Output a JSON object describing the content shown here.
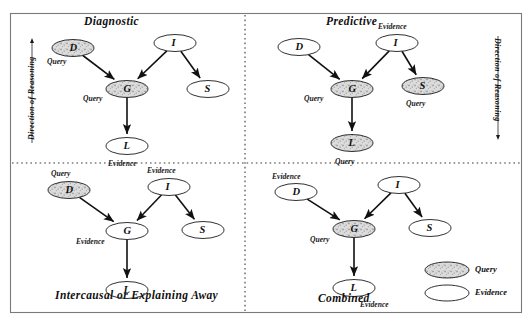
{
  "figure": {
    "background": "#ffffff",
    "border_color": "#7a7a7a",
    "divider_color": "#3a3a3a",
    "node_stroke": "#1a1a1a",
    "query_fill": "#d8d8d8",
    "evidence_fill": "#ffffff",
    "arrow_color": "#111111"
  },
  "panels": {
    "diagnostic": {
      "title": "Diagnostic",
      "direction_label": "Direction of Reasoning",
      "direction_arrow": "up",
      "nodes": [
        {
          "id": "D",
          "label": "D",
          "type": "query",
          "tag": "Query",
          "cx": 73,
          "cy": 48
        },
        {
          "id": "I",
          "label": "I",
          "type": "evidence",
          "tag": "",
          "cx": 175,
          "cy": 43
        },
        {
          "id": "G",
          "label": "G",
          "type": "query",
          "tag": "Query",
          "cx": 127,
          "cy": 89
        },
        {
          "id": "S",
          "label": "S",
          "type": "evidence",
          "tag": "",
          "cx": 208,
          "cy": 89
        },
        {
          "id": "L",
          "label": "L",
          "type": "evidence",
          "tag": "Evidence",
          "cx": 127,
          "cy": 146
        }
      ],
      "edges": [
        {
          "from": "D",
          "to": "G"
        },
        {
          "from": "I",
          "to": "G"
        },
        {
          "from": "I",
          "to": "S"
        },
        {
          "from": "G",
          "to": "L"
        }
      ]
    },
    "predictive": {
      "title": "Predictive",
      "direction_label": "Direction of Reasoning",
      "direction_arrow": "down",
      "nodes": [
        {
          "id": "D",
          "label": "D",
          "type": "evidence",
          "tag": "",
          "cx": 299,
          "cy": 47
        },
        {
          "id": "I",
          "label": "I",
          "type": "evidence",
          "tag": "Evidence",
          "cx": 397,
          "cy": 43
        },
        {
          "id": "G",
          "label": "G",
          "type": "query",
          "tag": "Query",
          "cx": 352,
          "cy": 89
        },
        {
          "id": "S",
          "label": "S",
          "type": "query",
          "tag": "Query",
          "cx": 423,
          "cy": 86
        },
        {
          "id": "L",
          "label": "L",
          "type": "query",
          "tag": "Query",
          "cx": 352,
          "cy": 143
        }
      ],
      "edges": [
        {
          "from": "D",
          "to": "G"
        },
        {
          "from": "I",
          "to": "G"
        },
        {
          "from": "I",
          "to": "S"
        },
        {
          "from": "G",
          "to": "L"
        }
      ]
    },
    "intercausal": {
      "title": "Intercausal or Explaining Away",
      "nodes": [
        {
          "id": "D",
          "label": "D",
          "type": "query",
          "tag": "Query",
          "cx": 69,
          "cy": 190
        },
        {
          "id": "I",
          "label": "I",
          "type": "evidence",
          "tag": "Evidence",
          "cx": 169,
          "cy": 187
        },
        {
          "id": "G",
          "label": "G",
          "type": "evidence",
          "tag": "Evidence",
          "cx": 127,
          "cy": 231
        },
        {
          "id": "S",
          "label": "S",
          "type": "evidence",
          "tag": "",
          "cx": 203,
          "cy": 230
        },
        {
          "id": "L",
          "label": "L",
          "type": "evidence",
          "tag": "",
          "cx": 127,
          "cy": 290
        }
      ],
      "edges": [
        {
          "from": "D",
          "to": "G"
        },
        {
          "from": "I",
          "to": "G"
        },
        {
          "from": "I",
          "to": "S"
        },
        {
          "from": "G",
          "to": "L"
        }
      ]
    },
    "combined": {
      "title": "Combined",
      "nodes": [
        {
          "id": "D",
          "label": "D",
          "type": "evidence",
          "tag": "Evidence",
          "cx": 296,
          "cy": 192
        },
        {
          "id": "I",
          "label": "I",
          "type": "evidence",
          "tag": "",
          "cx": 399,
          "cy": 185
        },
        {
          "id": "G",
          "label": "G",
          "type": "query",
          "tag": "Query",
          "cx": 354,
          "cy": 229
        },
        {
          "id": "S",
          "label": "S",
          "type": "evidence",
          "tag": "",
          "cx": 430,
          "cy": 228
        },
        {
          "id": "L",
          "label": "L",
          "type": "evidence",
          "tag": "Evidence",
          "cx": 354,
          "cy": 288
        }
      ],
      "edges": [
        {
          "from": "D",
          "to": "G"
        },
        {
          "from": "I",
          "to": "G"
        },
        {
          "from": "I",
          "to": "S"
        },
        {
          "from": "G",
          "to": "L"
        }
      ]
    }
  },
  "legend": {
    "items": [
      {
        "label": "Query",
        "type": "query",
        "cx": 447,
        "cy": 270
      },
      {
        "label": "Evidence",
        "type": "evidence",
        "cx": 447,
        "cy": 293
      }
    ]
  }
}
